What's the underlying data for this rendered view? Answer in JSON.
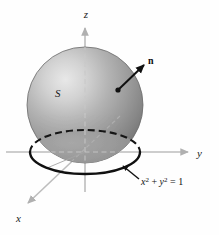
{
  "figure": {
    "kind": "3d-math-diagram",
    "background_color": "#fefefe",
    "axes": {
      "z": {
        "label": "z",
        "label_x": 86,
        "label_y": 16,
        "color": "#b9b9b9",
        "x1": 85,
        "y1": 190,
        "x2": 85,
        "y2": 26
      },
      "y": {
        "label": "y",
        "label_x": 199,
        "label_y": 156,
        "color": "#b9b9b9",
        "x1": 8,
        "y1": 152,
        "x2": 186,
        "y2": 152
      },
      "x": {
        "label": "x",
        "label_x": 18,
        "label_y": 220,
        "color": "#b9b9b9",
        "x1": 118,
        "y1": 118,
        "x2": 26,
        "y2": 205
      }
    },
    "sphere": {
      "center_x": 85,
      "center_y": 105,
      "radius": 58,
      "highlight_x": 56,
      "highlight_y": 72,
      "light_color": "#e3e3e3",
      "mid_color": "#9d9d9d",
      "dark_color": "#6e6e6e",
      "edge_color": "#565656"
    },
    "surface_label": {
      "text": "S",
      "x": 58,
      "y": 95
    },
    "normal_vector": {
      "label": "n",
      "label_x": 150,
      "label_y": 62,
      "base_x": 118,
      "base_y": 90,
      "tip_x": 145,
      "tip_y": 64,
      "color": "#111111",
      "dot_radius": 2.6
    },
    "boundary_circle": {
      "center_x": 85,
      "center_y": 152,
      "rx": 55,
      "ry": 22,
      "solid_color": "#151515",
      "dashed_color": "#151515",
      "dash_pattern": "7,4"
    },
    "equation_annotation": {
      "text_parts": [
        {
          "t": "x",
          "style": "it"
        },
        {
          "t": "2",
          "style": "sup"
        },
        {
          "t": " + ",
          "style": "plain"
        },
        {
          "t": "y",
          "style": "it"
        },
        {
          "t": "2",
          "style": "sup"
        },
        {
          "t": " = 1",
          "style": "plain"
        }
      ],
      "plain_text": "x2 + y2 = 1",
      "x": 140,
      "y": 182,
      "leader_from_x": 139,
      "leader_from_y": 178,
      "leader_to_x": 122,
      "leader_to_y": 166
    },
    "radius_line": {
      "x1": 85,
      "y1": 152,
      "x2": 46,
      "y2": 168,
      "color": "#a8a8a8"
    }
  }
}
